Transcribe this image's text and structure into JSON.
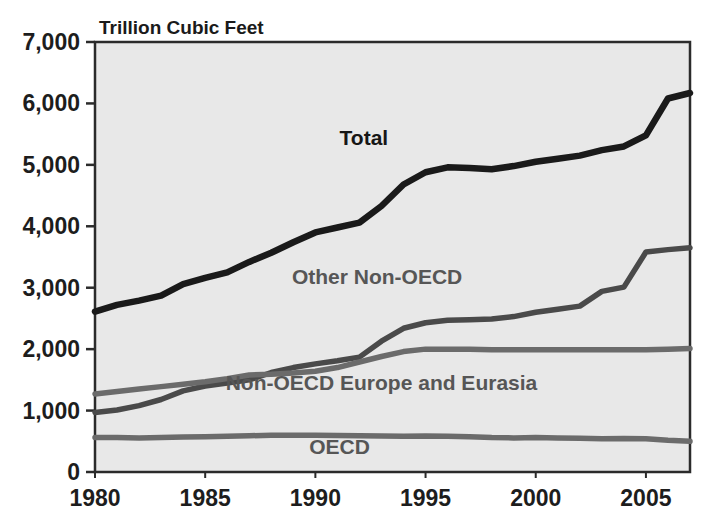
{
  "chart_data": {
    "type": "line",
    "title": "",
    "subtitle": "",
    "unit_label": "Trillion Cubic Feet",
    "xlabel": "",
    "ylabel": "",
    "xlim": [
      1980,
      2007
    ],
    "ylim": [
      0,
      7000
    ],
    "grid": false,
    "legend_position": "inline-annotations",
    "x_tick_labels": [
      "1980",
      "1985",
      "1990",
      "1995",
      "2000",
      "2005"
    ],
    "x_tick_values": [
      1980,
      1985,
      1990,
      1995,
      2000,
      2005
    ],
    "y_tick_labels": [
      "0",
      "1,000",
      "2,000",
      "3,000",
      "4,000",
      "5,000",
      "6,000",
      "7,000"
    ],
    "y_tick_values": [
      0,
      1000,
      2000,
      3000,
      4000,
      5000,
      6000,
      7000
    ],
    "x": [
      1980,
      1981,
      1982,
      1983,
      1984,
      1985,
      1986,
      1987,
      1988,
      1989,
      1990,
      1991,
      1992,
      1993,
      1994,
      1995,
      1996,
      1997,
      1998,
      1999,
      2000,
      2001,
      2002,
      2003,
      2004,
      2005,
      2006,
      2007
    ],
    "series": [
      {
        "name": "Total",
        "color": "#1a1a1a",
        "label_x": 1992.2,
        "label_y": 5320,
        "values": [
          2610,
          2720,
          2790,
          2870,
          3060,
          3160,
          3250,
          3420,
          3570,
          3740,
          3900,
          3980,
          4060,
          4330,
          4680,
          4880,
          4960,
          4950,
          4930,
          4980,
          5050,
          5100,
          5150,
          5240,
          5300,
          5480,
          6080,
          6170
        ]
      },
      {
        "name": "Other Non-OECD",
        "color": "#4a4a4a",
        "label_x": 1992.8,
        "label_y": 3060,
        "values": [
          970,
          1010,
          1080,
          1180,
          1320,
          1400,
          1450,
          1500,
          1620,
          1700,
          1760,
          1810,
          1870,
          2130,
          2340,
          2430,
          2470,
          2480,
          2490,
          2530,
          2600,
          2650,
          2700,
          2940,
          3010,
          3580,
          3620,
          3650
        ]
      },
      {
        "name": "Non-OECD Europe and Eurasia",
        "color": "#6b6b6b",
        "label_x": 1993.0,
        "label_y": 1340,
        "values": [
          1270,
          1310,
          1350,
          1390,
          1430,
          1470,
          1520,
          1580,
          1590,
          1610,
          1640,
          1700,
          1790,
          1880,
          1960,
          2000,
          2000,
          2000,
          1990,
          1990,
          1990,
          1990,
          1990,
          1990,
          1990,
          1990,
          2000,
          2010
        ]
      },
      {
        "name": "OECD",
        "color": "#6b6b6b",
        "label_x": 1991.1,
        "label_y": 300,
        "values": [
          560,
          560,
          555,
          560,
          570,
          575,
          580,
          590,
          600,
          600,
          600,
          595,
          590,
          585,
          580,
          585,
          580,
          575,
          560,
          555,
          560,
          555,
          550,
          540,
          545,
          540,
          515,
          500
        ]
      }
    ],
    "plot_area": {
      "x0": 95,
      "y0": 42,
      "x1": 690,
      "y1": 472
    },
    "plot_background": "#e8e8e8",
    "frame_color": "#2b2b2b"
  }
}
